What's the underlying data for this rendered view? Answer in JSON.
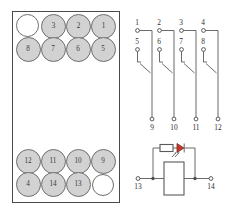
{
  "diagram": {
    "socket_panel": {
      "name": "socket-pin-layout",
      "rows": [
        {
          "row": 1,
          "pins": [
            {
              "label": "",
              "filled": false
            },
            {
              "label": "3",
              "filled": true
            },
            {
              "label": "2",
              "filled": true
            },
            {
              "label": "1",
              "filled": true
            }
          ]
        },
        {
          "row": 2,
          "pins": [
            {
              "label": "8",
              "filled": true
            },
            {
              "label": "7",
              "filled": true
            },
            {
              "label": "6",
              "filled": true
            },
            {
              "label": "5",
              "filled": true
            }
          ]
        },
        {
          "row": 3,
          "pins": [
            {
              "label": "12",
              "filled": true
            },
            {
              "label": "11",
              "filled": true
            },
            {
              "label": "10",
              "filled": true
            },
            {
              "label": "9",
              "filled": true
            }
          ]
        },
        {
          "row": 4,
          "pins": [
            {
              "label": "4",
              "filled": true
            },
            {
              "label": "14",
              "filled": true
            },
            {
              "label": "13",
              "filled": true
            },
            {
              "label": "",
              "filled": false
            }
          ]
        }
      ]
    },
    "schematic": {
      "name": "contact-schematic",
      "contacts": [
        {
          "nc_terminal": "1",
          "common_terminal": "5",
          "no_terminal": "9"
        },
        {
          "nc_terminal": "2",
          "common_terminal": "6",
          "no_terminal": "10"
        },
        {
          "nc_terminal": "3",
          "common_terminal": "7",
          "no_terminal": "11"
        },
        {
          "nc_terminal": "4",
          "common_terminal": "8",
          "no_terminal": "12"
        }
      ],
      "coil": {
        "name": "relay-coil",
        "left_terminal": "13",
        "right_terminal": "14",
        "indicator": "led-indicator",
        "series_element": "resistor"
      }
    },
    "colors": {
      "pin_fill": "#d2d2d2",
      "pin_stroke": "#6e6e6e",
      "panel_stroke": "#4a4a4a",
      "wire": "#5a5a5a",
      "led": "#c0392b",
      "text": "#2e2e2e"
    }
  }
}
